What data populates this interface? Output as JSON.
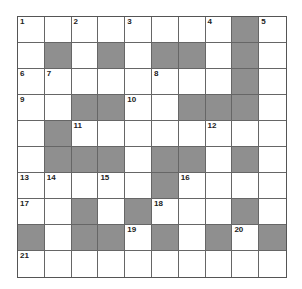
{
  "puzzle": {
    "type": "crossword",
    "rows": 10,
    "cols": 10,
    "block_color": "#8f8f8f",
    "line_color": "#666666",
    "grid": [
      "........#.",
      ".#.#.##.#.",
      "........#.",
      "..##..###.",
      ".#........",
      ".###.##.#.",
      ".....#....",
      "..#.#...#.",
      "#.##.#.#.#",
      ".........."
    ],
    "numbers": [
      {
        "r": 0,
        "c": 0,
        "n": "1"
      },
      {
        "r": 0,
        "c": 2,
        "n": "2"
      },
      {
        "r": 0,
        "c": 4,
        "n": "3"
      },
      {
        "r": 0,
        "c": 7,
        "n": "4"
      },
      {
        "r": 0,
        "c": 9,
        "n": "5"
      },
      {
        "r": 2,
        "c": 0,
        "n": "6"
      },
      {
        "r": 2,
        "c": 1,
        "n": "7"
      },
      {
        "r": 2,
        "c": 5,
        "n": "8"
      },
      {
        "r": 3,
        "c": 0,
        "n": "9"
      },
      {
        "r": 3,
        "c": 4,
        "n": "10"
      },
      {
        "r": 4,
        "c": 2,
        "n": "11"
      },
      {
        "r": 4,
        "c": 7,
        "n": "12"
      },
      {
        "r": 6,
        "c": 0,
        "n": "13"
      },
      {
        "r": 6,
        "c": 1,
        "n": "14"
      },
      {
        "r": 6,
        "c": 3,
        "n": "15"
      },
      {
        "r": 6,
        "c": 6,
        "n": "16"
      },
      {
        "r": 7,
        "c": 0,
        "n": "17"
      },
      {
        "r": 7,
        "c": 5,
        "n": "18"
      },
      {
        "r": 8,
        "c": 4,
        "n": "19"
      },
      {
        "r": 8,
        "c": 8,
        "n": "20"
      },
      {
        "r": 9,
        "c": 0,
        "n": "21"
      }
    ]
  }
}
